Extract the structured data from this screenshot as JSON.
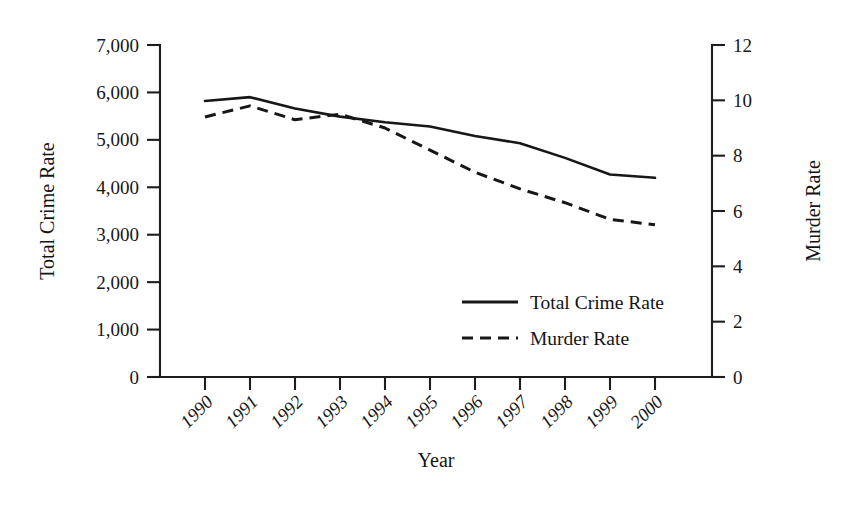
{
  "chart_data": {
    "type": "line",
    "title": "",
    "xlabel": "Year",
    "categories": [
      "1990",
      "1991",
      "1992",
      "1993",
      "1994",
      "1995",
      "1996",
      "1997",
      "1998",
      "1999",
      "2000"
    ],
    "grid": false,
    "legend_position": "center-right-inside",
    "axes": {
      "left": {
        "label": "Total Crime Rate",
        "min": 0,
        "max": 7000,
        "step": 1000,
        "ticks": [
          "0",
          "1,000",
          "2,000",
          "3,000",
          "4,000",
          "5,000",
          "6,000",
          "7,000"
        ]
      },
      "right": {
        "label": "Murder Rate",
        "min": 0,
        "max": 12,
        "step": 2,
        "ticks": [
          "0",
          "2",
          "4",
          "6",
          "8",
          "10",
          "12"
        ]
      }
    },
    "series": [
      {
        "name": "Total Crime Rate",
        "axis": "left",
        "style": "solid",
        "values": [
          5820,
          5900,
          5660,
          5490,
          5370,
          5280,
          5080,
          4930,
          4620,
          4270,
          4200
        ]
      },
      {
        "name": "Murder Rate",
        "axis": "right",
        "style": "dashed",
        "values": [
          9.4,
          9.8,
          9.3,
          9.5,
          9.0,
          8.2,
          7.4,
          6.8,
          6.3,
          5.7,
          5.5
        ]
      }
    ]
  },
  "legend": {
    "items": [
      {
        "label": "Total Crime Rate",
        "style": "solid"
      },
      {
        "label": "Murder Rate",
        "style": "dashed"
      }
    ]
  }
}
